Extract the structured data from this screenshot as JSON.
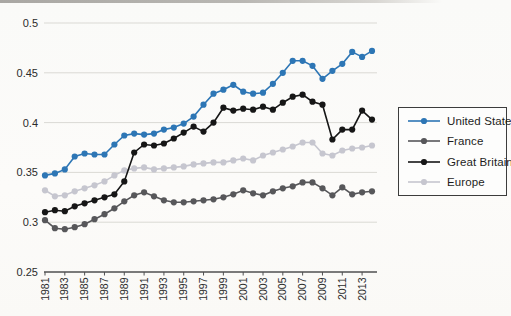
{
  "page": {
    "background_color": "#fbfaf8"
  },
  "chart_data": {
    "type": "line",
    "title": "",
    "xlabel": "",
    "ylabel": "",
    "grid": true,
    "ylim": [
      0.25,
      0.5
    ],
    "yticks": [
      0.5,
      0.45,
      0.4,
      0.35,
      0.3,
      0.25
    ],
    "ytick_labels": [
      "0.5",
      "0.45",
      "0.4",
      "0.35",
      "0.3",
      "0.25"
    ],
    "xtick_labels": [
      "1981",
      "1983",
      "1985",
      "1987",
      "1989",
      "1991",
      "1993",
      "1995",
      "1997",
      "1999",
      "2001",
      "2003",
      "2005",
      "2007",
      "2009",
      "2011",
      "2013"
    ],
    "x": [
      1981,
      1982,
      1983,
      1984,
      1985,
      1986,
      1987,
      1988,
      1989,
      1990,
      1991,
      1992,
      1993,
      1994,
      1995,
      1996,
      1997,
      1998,
      1999,
      2000,
      2001,
      2002,
      2003,
      2004,
      2005,
      2006,
      2007,
      2008,
      2009,
      2010,
      2011,
      2012,
      2013,
      2014
    ],
    "series": [
      {
        "name": "United States",
        "color": "#2d76b5",
        "values": [
          0.347,
          0.349,
          0.353,
          0.366,
          0.369,
          0.368,
          0.368,
          0.378,
          0.387,
          0.389,
          0.388,
          0.389,
          0.393,
          0.395,
          0.399,
          0.406,
          0.418,
          0.429,
          0.433,
          0.438,
          0.431,
          0.429,
          0.43,
          0.439,
          0.45,
          0.462,
          0.462,
          0.457,
          0.444,
          0.452,
          0.459,
          0.471,
          0.466,
          0.472
        ]
      },
      {
        "name": "France",
        "color": "#57575a",
        "values": [
          0.302,
          0.294,
          0.293,
          0.295,
          0.298,
          0.303,
          0.308,
          0.314,
          0.321,
          0.327,
          0.33,
          0.326,
          0.322,
          0.32,
          0.32,
          0.321,
          0.322,
          0.323,
          0.325,
          0.328,
          0.332,
          0.329,
          0.327,
          0.331,
          0.334,
          0.336,
          0.34,
          0.34,
          0.334,
          0.327,
          0.335,
          0.328,
          0.33,
          0.331
        ]
      },
      {
        "name": "Great Britain",
        "color": "#161616",
        "values": [
          0.31,
          0.312,
          0.311,
          0.316,
          0.319,
          0.322,
          0.325,
          0.328,
          0.341,
          0.37,
          0.378,
          0.377,
          0.379,
          0.384,
          0.39,
          0.396,
          0.391,
          0.4,
          0.415,
          0.412,
          0.414,
          0.413,
          0.416,
          0.413,
          0.42,
          0.426,
          0.428,
          0.421,
          0.418,
          0.383,
          0.393,
          0.393,
          0.412,
          0.403
        ]
      },
      {
        "name": "Europe",
        "color": "#c6c6cf",
        "values": [
          0.332,
          0.326,
          0.327,
          0.331,
          0.334,
          0.337,
          0.341,
          0.347,
          0.352,
          0.354,
          0.355,
          0.353,
          0.354,
          0.355,
          0.356,
          0.358,
          0.359,
          0.36,
          0.36,
          0.362,
          0.364,
          0.362,
          0.367,
          0.37,
          0.373,
          0.376,
          0.38,
          0.38,
          0.369,
          0.367,
          0.372,
          0.374,
          0.375,
          0.377
        ]
      }
    ],
    "legend_position": "right",
    "style": {
      "gridline_color": "#dad9d4",
      "axis_color": "#4f4f50",
      "tick_text_color": "#2b2b2b",
      "marker_radius": 3.1,
      "line_width": 1.6
    }
  }
}
